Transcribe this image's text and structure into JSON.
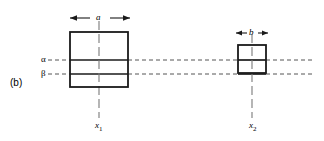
{
  "figure": {
    "panel_label": "(b)",
    "background_color": "#ffffff",
    "line_color": "#1a1a1a",
    "dashed_color": "#555555",
    "reference_lines": [
      {
        "name": "alpha",
        "label": "α",
        "y": 60,
        "x_start": 48,
        "x_end": 312
      },
      {
        "name": "beta",
        "label": "β",
        "y": 74,
        "x_start": 48,
        "x_end": 312
      }
    ],
    "shapes": [
      {
        "name": "left-rectangle",
        "x": 70,
        "y": 32,
        "width": 58,
        "height": 55,
        "dimension_label": "a",
        "axis_label": "x",
        "axis_subscript": "1",
        "center_x": 99,
        "axis_top": 21,
        "axis_bottom": 118
      },
      {
        "name": "right-rectangle",
        "x": 238,
        "y": 45,
        "width": 28,
        "height": 28,
        "dimension_label": "b",
        "axis_label": "x",
        "axis_subscript": "2",
        "center_x": 252,
        "axis_top": 34,
        "axis_bottom": 118
      }
    ],
    "dimension_arrows": [
      {
        "name": "dimension-a",
        "label": "a",
        "y": 18,
        "x_start": 70,
        "x_end": 130
      },
      {
        "name": "dimension-b",
        "label": "b",
        "y": 33,
        "x_start": 236,
        "x_end": 268
      }
    ]
  }
}
